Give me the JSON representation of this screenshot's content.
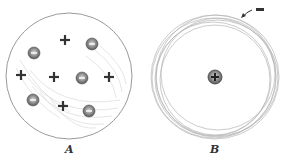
{
  "diagram": {
    "panels": [
      {
        "id": "A",
        "label": "A",
        "description": "Sphere of positive charge with embedded electrons",
        "positive_charges": [
          [
            65,
            40
          ],
          [
            21,
            75
          ],
          [
            54,
            77
          ],
          [
            109,
            77
          ],
          [
            63,
            106
          ]
        ],
        "electrons": [
          [
            92,
            44
          ],
          [
            34,
            53
          ],
          [
            82,
            78
          ],
          [
            33,
            100
          ],
          [
            89,
            111
          ]
        ]
      },
      {
        "id": "B",
        "label": "B",
        "description": "Positive nucleus with orbiting electron",
        "nucleus_symbol": "+",
        "electron_symbol": "−"
      }
    ],
    "colors": {
      "ink": "#333333",
      "light_ink": "#b5b5b5",
      "electron_fill": "#8a8a8a"
    }
  }
}
